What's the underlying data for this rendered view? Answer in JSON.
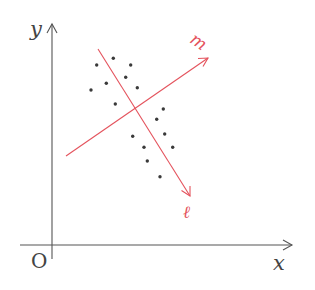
{
  "diagram": {
    "type": "scatter-with-principal-axes",
    "axes": {
      "x_label": "x",
      "y_label": "y",
      "origin_label": "O",
      "x_axis": {
        "y": 245,
        "x_start": 20,
        "x_end": 292
      },
      "y_axis": {
        "x": 52,
        "y_start": 259,
        "y_end": 24
      }
    },
    "lines": [
      {
        "name": "ℓ",
        "label": "ℓ",
        "color": "#e4525c",
        "from": [
          98,
          49
        ],
        "to": [
          190,
          196
        ],
        "label_pos": [
          185,
          218
        ]
      },
      {
        "name": "m",
        "label": "m",
        "color": "#e4525c",
        "from": [
          66,
          156
        ],
        "to": [
          208,
          58
        ],
        "label_pos": [
          196,
          50
        ]
      }
    ],
    "intersection": [
      134,
      108
    ],
    "points": [
      [
        96.7,
        65
      ],
      [
        113.3,
        58.3
      ],
      [
        130.7,
        65
      ],
      [
        125.7,
        77.3
      ],
      [
        106.3,
        83.3
      ],
      [
        137.3,
        87.7
      ],
      [
        91,
        90
      ],
      [
        115.3,
        104
      ],
      [
        163.3,
        109
      ],
      [
        156.7,
        119.3
      ],
      [
        164.7,
        134
      ],
      [
        132.7,
        136.3
      ],
      [
        144,
        147.3
      ],
      [
        172.7,
        147.3
      ],
      [
        147.3,
        161
      ],
      [
        160,
        176.7
      ]
    ],
    "point_color": "#3a3a3a"
  }
}
